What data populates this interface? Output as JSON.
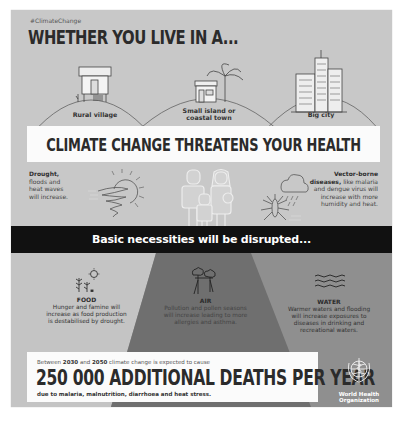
{
  "header": {
    "hashtag": "#ClimateChange",
    "title": "WHETHER YOU LIVE IN A..."
  },
  "locations": [
    {
      "label_line1": "Rural village",
      "label_line2": "",
      "icon": "stilt-house-icon"
    },
    {
      "label_line1": "Small island or",
      "label_line2": "coastal town",
      "icon": "palm-hut-icon"
    },
    {
      "label_line1": "Big city",
      "label_line2": "",
      "icon": "skyscrapers-icon"
    }
  ],
  "headline": "CLIMATE CHANGE THREATENS YOUR HEALTH",
  "threats": {
    "left": {
      "bold": "Drought,",
      "lines": [
        "floods and",
        "heat waves",
        "will increase."
      ],
      "icon": "tornado-sun-icon"
    },
    "center_icon": "family-icon",
    "right": {
      "bold_line1": "Vector-borne",
      "bold_line2": "diseases,",
      "rest_line2": " like malaria",
      "lines": [
        "and dengue virus will",
        "increase with more",
        "humidity and heat."
      ],
      "icon": "mosquito-rain-cloud-icon"
    }
  },
  "banner": "Basic necessities will be disrupted...",
  "necessities": [
    {
      "heading": "FOOD",
      "lines": [
        "Hunger and famine will",
        "increase as food production",
        "is destabilised by drought."
      ],
      "icon": "plants-icon"
    },
    {
      "heading": "AIR",
      "lines": [
        "Pollution and pollen seasons",
        "will increase leading to more",
        "allergies and asthma."
      ],
      "icon": "trees-icon"
    },
    {
      "heading": "WATER",
      "lines": [
        "Warmer waters and flooding",
        "will increase exposures to",
        "diseases in drinking and",
        "recreational waters."
      ],
      "icon": "waves-icon"
    }
  ],
  "deaths": {
    "pre_a": "Between ",
    "year_start": "2030",
    "pre_b": " and ",
    "year_end": "2050",
    "pre_c": " climate change is expected to cause",
    "big": "250 000 ADDITIONAL DEATHS PER YEAR",
    "post": "due to malaria, malnutrition, diarrhoea and heat stress."
  },
  "who": {
    "line1": "World Health",
    "line2": "Organization",
    "icon": "who-emblem-icon"
  },
  "colors": {
    "background": "#c8c8c8",
    "panel_left": "#c4c4c4",
    "panel_middle": "#6f6f6f",
    "panel_right": "#8f8f8f",
    "banner": "#111111",
    "text_dark": "#2b2b2b"
  }
}
